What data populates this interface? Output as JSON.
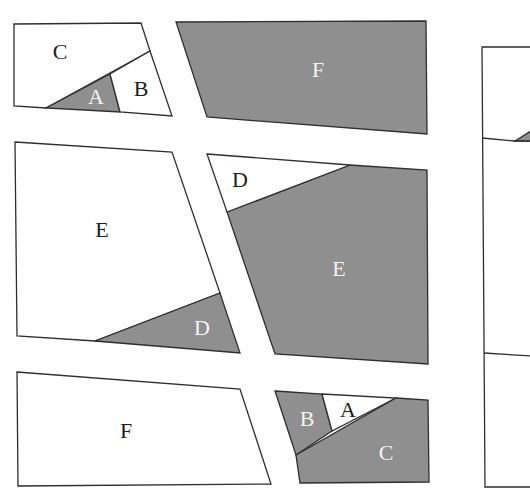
{
  "diagram": {
    "colors": {
      "shaded": "#8f8f8f",
      "unshaded": "#ffffff",
      "stroke": "#2e2e2e"
    },
    "figures": [
      {
        "id": "fig-top-left",
        "pieces": [
          {
            "label": "C",
            "shade": "white"
          },
          {
            "label": "A",
            "shade": "gray"
          },
          {
            "label": "B",
            "shade": "white"
          }
        ]
      },
      {
        "id": "fig-top-middle",
        "pieces": [
          {
            "label": "F",
            "shade": "gray"
          }
        ]
      },
      {
        "id": "fig-middle-left",
        "pieces": [
          {
            "label": "E",
            "shade": "white"
          },
          {
            "label": "D",
            "shade": "gray"
          }
        ]
      },
      {
        "id": "fig-middle-center",
        "pieces": [
          {
            "label": "D",
            "shade": "white"
          },
          {
            "label": "E",
            "shade": "gray"
          }
        ]
      },
      {
        "id": "fig-bottom-left",
        "pieces": [
          {
            "label": "F",
            "shade": "white"
          }
        ]
      },
      {
        "id": "fig-bottom-center",
        "pieces": [
          {
            "label": "B",
            "shade": "gray"
          },
          {
            "label": "A",
            "shade": "white"
          },
          {
            "label": "C",
            "shade": "gray"
          }
        ]
      },
      {
        "id": "fig-right-partial",
        "pieces": []
      }
    ]
  }
}
